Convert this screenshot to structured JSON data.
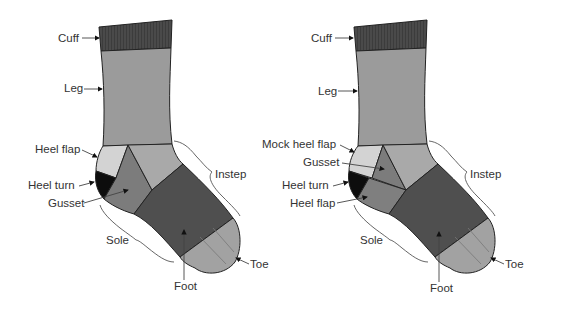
{
  "colors": {
    "cuff": "#4a4a4a",
    "leg": "#9b9b9b",
    "heel_flap": "#d3d3d3",
    "mock_heel_flap": "#d3d3d3",
    "heel_turn": "#0d0d0d",
    "gusset": "#7c7c7c",
    "instep_upper": "#a9a9a9",
    "foot": "#4f4f4f",
    "toe": "#a2a2a2",
    "heel_flap_right": "#7f7f7f",
    "outline": "#222222",
    "label": "#333333"
  },
  "left_sock": {
    "labels": {
      "cuff": "Cuff",
      "leg": "Leg",
      "heel_flap": "Heel flap",
      "heel_turn": "Heel turn",
      "gusset": "Gusset",
      "instep": "Instep",
      "sole": "Sole",
      "foot": "Foot",
      "toe": "Toe"
    }
  },
  "right_sock": {
    "labels": {
      "cuff": "Cuff",
      "leg": "Leg",
      "mock_heel_flap": "Mock heel flap",
      "gusset": "Gusset",
      "heel_turn": "Heel turn",
      "heel_flap": "Heel flap",
      "instep": "Instep",
      "sole": "Sole",
      "foot": "Foot",
      "toe": "Toe"
    }
  }
}
